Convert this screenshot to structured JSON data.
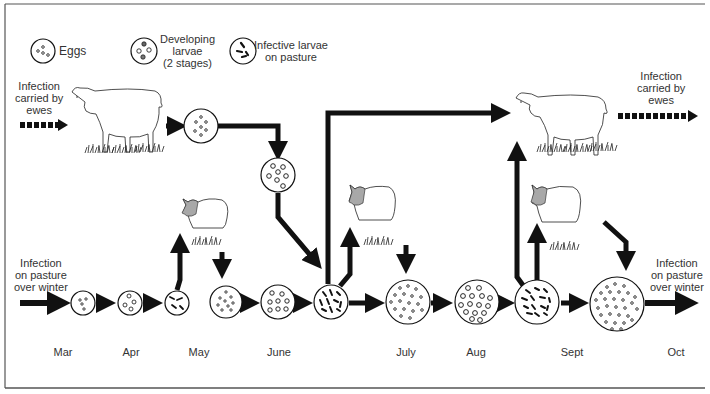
{
  "legend": {
    "eggs": "Eggs",
    "developing": [
      "Developing",
      "larvae",
      "(2 stages)"
    ],
    "infective": [
      "Infective larvae",
      "on pasture"
    ]
  },
  "labels": {
    "carried_left": [
      "Infection",
      "carried by",
      "ewes"
    ],
    "carried_right": [
      "Infection",
      "carried by",
      "ewes"
    ],
    "pasture_left": [
      "Infection",
      "on pasture",
      "over winter"
    ],
    "pasture_right": [
      "Infection",
      "on pasture",
      "over winter"
    ]
  },
  "months": [
    "Mar",
    "Apr",
    "May",
    "June",
    "July",
    "Aug",
    "Sept",
    "Oct"
  ],
  "colors": {
    "ink": "#111111",
    "text": "#333333",
    "lamb_head": "#a8a8a8",
    "frame": "#444444"
  },
  "stages": [
    {
      "month": "Mar",
      "type": "eggs"
    },
    {
      "month": "Apr",
      "type": "developing"
    },
    {
      "month": "May",
      "type": "infective"
    },
    {
      "month": "May",
      "type": "eggs"
    },
    {
      "month": "June",
      "type": "developing"
    },
    {
      "month": "June",
      "type": "infective"
    },
    {
      "month": "July",
      "type": "eggs"
    },
    {
      "month": "Aug",
      "type": "developing"
    },
    {
      "month": "Sept",
      "type": "infective"
    },
    {
      "month": "Oct",
      "type": "eggs"
    }
  ]
}
